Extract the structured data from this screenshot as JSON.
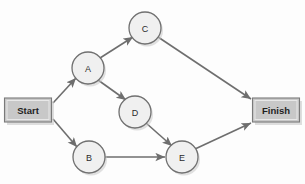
{
  "diagram": {
    "type": "network-activity-diagram",
    "canvas": {
      "width": 305,
      "height": 184,
      "background": "#fdfdfd"
    },
    "colors": {
      "edge_stroke": "#6e6e6e",
      "circle_fill": "#f0f0f0",
      "circle_stroke": "#707070",
      "box_fill": "#c8c8c8",
      "box_stroke": "#7a7a7a",
      "shadow": "#c9c9c9",
      "label_text": "#2b2b2b"
    },
    "nodes": [
      {
        "id": "start",
        "label": "Start",
        "shape": "rect",
        "x": 28,
        "y": 110,
        "w": 47,
        "h": 24
      },
      {
        "id": "a",
        "label": "A",
        "shape": "circle",
        "x": 88,
        "y": 68,
        "r": 16
      },
      {
        "id": "b",
        "label": "B",
        "shape": "circle",
        "x": 89,
        "y": 157,
        "r": 16
      },
      {
        "id": "c",
        "label": "C",
        "shape": "circle",
        "x": 145,
        "y": 28,
        "r": 16
      },
      {
        "id": "d",
        "label": "D",
        "shape": "circle",
        "x": 135,
        "y": 112,
        "r": 16
      },
      {
        "id": "e",
        "label": "E",
        "shape": "circle",
        "x": 182,
        "y": 157,
        "r": 16
      },
      {
        "id": "finish",
        "label": "Finish",
        "shape": "rect",
        "x": 276,
        "y": 110,
        "w": 47,
        "h": 24
      }
    ],
    "edges": [
      {
        "id": "start-a",
        "from": "start",
        "to": "a",
        "x1": 53,
        "y1": 103,
        "x2": 76,
        "y2": 78,
        "arrow": true
      },
      {
        "id": "start-b",
        "from": "start",
        "to": "b",
        "x1": 53,
        "y1": 119,
        "x2": 77,
        "y2": 147,
        "arrow": true
      },
      {
        "id": "a-c",
        "from": "a",
        "to": "c",
        "x1": 100,
        "y1": 58,
        "x2": 133,
        "y2": 37,
        "arrow": true
      },
      {
        "id": "a-d",
        "from": "a",
        "to": "d",
        "x1": 98,
        "y1": 80,
        "x2": 126,
        "y2": 100,
        "arrow": true
      },
      {
        "id": "c-finish",
        "from": "c",
        "to": "finish",
        "x1": 158,
        "y1": 37,
        "x2": 251,
        "y2": 99,
        "arrow": true
      },
      {
        "id": "d-e",
        "from": "d",
        "to": "e",
        "x1": 146,
        "y1": 123,
        "x2": 172,
        "y2": 146,
        "arrow": true
      },
      {
        "id": "b-e",
        "from": "b",
        "to": "e",
        "x1": 105,
        "y1": 157,
        "x2": 165,
        "y2": 157,
        "arrow": true
      },
      {
        "id": "e-finish",
        "from": "e",
        "to": "finish",
        "x1": 195,
        "y1": 149,
        "x2": 251,
        "y2": 123,
        "arrow": true
      }
    ]
  }
}
